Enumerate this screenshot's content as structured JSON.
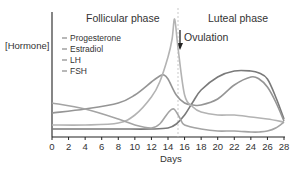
{
  "chart_data": {
    "type": "line",
    "title": "",
    "xlabel": "Days",
    "ylabel": "[Hormone]",
    "xlim": [
      0,
      28
    ],
    "x_ticks": [
      0,
      2,
      4,
      6,
      8,
      10,
      12,
      14,
      16,
      18,
      20,
      22,
      24,
      26,
      28
    ],
    "grid": false,
    "legend_position": "upper-left",
    "annotations": {
      "follicular_phase": "Follicular phase",
      "luteal_phase": "Luteal phase",
      "ovulation": "Ovulation",
      "ovulation_day": 15.2
    },
    "series": [
      {
        "name": "Progesterone",
        "color": "#7a7a7a",
        "x": [
          0,
          4,
          8,
          12,
          14,
          15,
          16,
          17,
          18,
          20,
          22,
          24,
          25,
          26,
          27,
          28
        ],
        "y": [
          8,
          8,
          8,
          8,
          9,
          13,
          22,
          35,
          47,
          60,
          66,
          66,
          64,
          58,
          40,
          18
        ]
      },
      {
        "name": "Estradiol",
        "color": "#959595",
        "x": [
          0,
          4,
          8,
          10,
          12,
          13,
          13.5,
          14,
          15,
          16,
          17,
          18,
          20,
          22,
          24,
          25,
          26,
          27,
          28
        ],
        "y": [
          24,
          28,
          34,
          42,
          55,
          61,
          62,
          58,
          42,
          34,
          32,
          32,
          38,
          52,
          60,
          58,
          50,
          35,
          16
        ]
      },
      {
        "name": "LH",
        "color": "#b3b3b3",
        "x": [
          0,
          4,
          8,
          10,
          12,
          13,
          14,
          14.5,
          14.8,
          15.2,
          16,
          17,
          18,
          20,
          22,
          24,
          26,
          28
        ],
        "y": [
          12,
          12,
          14,
          22,
          40,
          55,
          80,
          98,
          118,
          90,
          42,
          30,
          25,
          22,
          22,
          20,
          18,
          15
        ]
      },
      {
        "name": "FSH",
        "color": "#a4a4a4",
        "x": [
          0,
          4,
          8,
          10,
          12,
          13,
          14,
          14.7,
          15.5,
          16,
          18,
          20,
          22,
          24,
          25,
          26,
          27,
          28
        ],
        "y": [
          34,
          28,
          18,
          12,
          9,
          13,
          24,
          28,
          18,
          12,
          8,
          6,
          6,
          5,
          5,
          6,
          9,
          15
        ]
      }
    ],
    "ylim": [
      0,
      125
    ]
  },
  "labels": {
    "follicular": "Follicular phase",
    "luteal": "Luteal phase",
    "ovulation": "Ovulation",
    "ylabel": "[Hormone]",
    "xlabel": "Days"
  },
  "legend": [
    {
      "label": "Progesterone"
    },
    {
      "label": "Estradiol"
    },
    {
      "label": "LH"
    },
    {
      "label": "FSH"
    }
  ],
  "ticks": [
    "0",
    "2",
    "4",
    "6",
    "8",
    "10",
    "12",
    "14",
    "16",
    "18",
    "20",
    "22",
    "24",
    "26",
    "28"
  ]
}
